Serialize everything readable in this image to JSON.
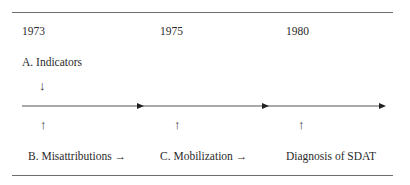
{
  "diagram": {
    "type": "timeline",
    "years": [
      {
        "label": "1973"
      },
      {
        "label": "1975"
      },
      {
        "label": "1980"
      }
    ],
    "top_annotation": {
      "label": "A. Indicators",
      "arrow": "↓"
    },
    "bottom_annotations": [
      {
        "label": "B. Misattributions →",
        "arrow": "↑"
      },
      {
        "label": "C. Mobilization →",
        "arrow": "↑"
      },
      {
        "label": "Diagnosis of SDAT",
        "arrow": "↑"
      }
    ],
    "colors": {
      "line": "#555555",
      "rule": "#6e6e6e",
      "text": "#2b2b2b"
    }
  }
}
